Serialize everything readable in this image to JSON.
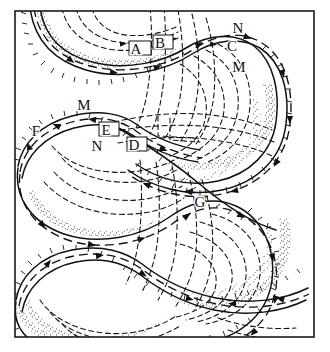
{
  "figure": {
    "frame": {
      "color": "#1a1a1a",
      "x": 15,
      "y": 11,
      "width": 299,
      "height": 326,
      "stroke_width": 1.6
    },
    "background_color": "#ffffff",
    "ink_color": "#111111",
    "stipple_color": "#4a4a4a"
  },
  "labels": [
    {
      "id": "label-a",
      "text": "A",
      "x": 136,
      "y": 54,
      "boxed": true
    },
    {
      "id": "label-b",
      "text": "B",
      "x": 160,
      "y": 48,
      "boxed": true
    },
    {
      "id": "label-c",
      "text": "C",
      "x": 232,
      "y": 51,
      "boxed": false
    },
    {
      "id": "label-n-top",
      "text": "N",
      "x": 238,
      "y": 33,
      "boxed": false
    },
    {
      "id": "label-m-top",
      "text": "M",
      "x": 239,
      "y": 72,
      "boxed": false
    },
    {
      "id": "label-m-mid",
      "text": "M",
      "x": 84,
      "y": 110,
      "boxed": false
    },
    {
      "id": "label-f",
      "text": "F",
      "x": 36,
      "y": 136,
      "boxed": false
    },
    {
      "id": "label-e",
      "text": "E",
      "x": 106,
      "y": 135,
      "boxed": true
    },
    {
      "id": "label-n-mid",
      "text": "N",
      "x": 97,
      "y": 151,
      "boxed": false
    },
    {
      "id": "label-d",
      "text": "D",
      "x": 134,
      "y": 150,
      "boxed": true
    },
    {
      "id": "label-g",
      "text": "G",
      "x": 200,
      "y": 207,
      "boxed": false
    }
  ],
  "legend_semantics": {
    "solid_line": "frontal boundary",
    "barbed_line": "cold front with ticks",
    "dashed_contour": "isotherm contour",
    "dashed_arrow_line": "flow streamline with arrowheads",
    "stipple_band": "shaded air-mass band"
  }
}
